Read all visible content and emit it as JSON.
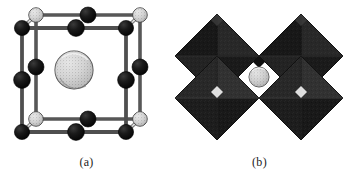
{
  "figure": {
    "background_color": "#ffffff",
    "panels": [
      {
        "id": "a",
        "caption": "(a)",
        "representation": "ball-and-stick unit cell",
        "cube": {
          "edge_color": "#5a5a5a",
          "edge_fill": "#e8e8e8",
          "front_face_origin": [
            22,
            28
          ],
          "face_size": 104,
          "depth_offset": [
            14,
            -13
          ]
        },
        "atoms": {
          "corner": {
            "label": "corner-atom",
            "style": "light stippled sphere",
            "fill": "#cfcfcf",
            "outline": "#3a3a3a",
            "radius": 7,
            "count": 8
          },
          "edge_mid": {
            "label": "edge-midpoint-atom",
            "style": "solid black sphere",
            "fill": "#131313",
            "outline": "#000000",
            "radius": 8,
            "count": 12
          },
          "center": {
            "label": "body-center-atom",
            "style": "large light stippled sphere",
            "fill": "#d6d6d6",
            "outline": "#4a4a4a",
            "radius": 19,
            "count": 1
          }
        }
      },
      {
        "id": "b",
        "caption": "(b)",
        "representation": "corner-sharing octahedra",
        "octahedra": {
          "label": "octahedron",
          "count": 4,
          "arrangement": "2x2 corner-sharing",
          "fill_dark": "#1b1b1b",
          "fill_mid": "#2e2e2e",
          "fill_light": "#3d3d3d",
          "outline": "#000000",
          "half_width": 46,
          "half_height": 46
        },
        "center_atom": {
          "label": "central-cation",
          "style": "small light stippled sphere",
          "fill": "#cccccc",
          "outline": "#555555",
          "radius": 10
        }
      }
    ]
  }
}
